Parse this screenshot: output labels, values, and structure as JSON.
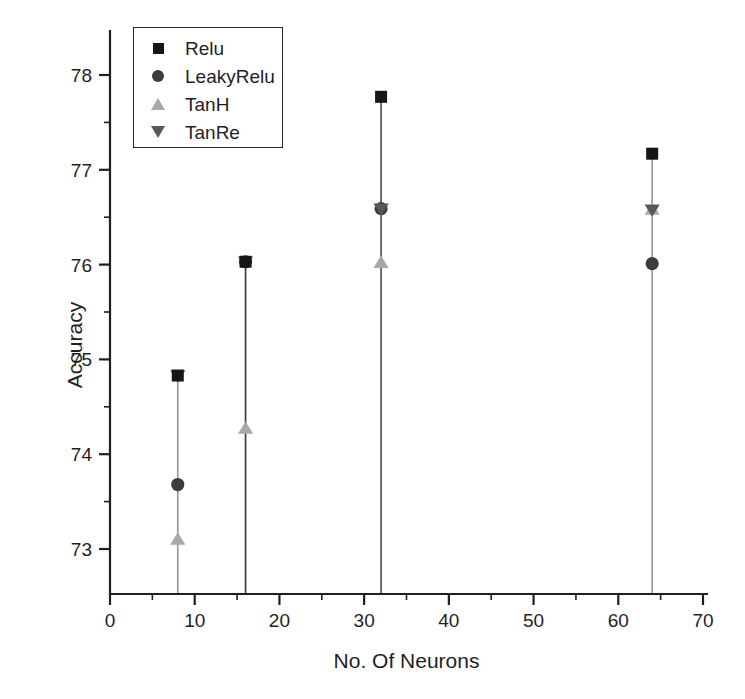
{
  "chart_data": {
    "type": "scatter",
    "title": "",
    "xlabel": "No. Of Neurons",
    "ylabel": "Accuracy",
    "xlim": [
      0,
      70
    ],
    "ylim": [
      72.62,
      78.4
    ],
    "xticks": [
      0,
      10,
      20,
      30,
      40,
      50,
      60,
      70
    ],
    "yticks": [
      73,
      74,
      75,
      76,
      77,
      78
    ],
    "xtick_labels": [
      "0",
      "10",
      "20",
      "30",
      "40",
      "50",
      "60",
      "70"
    ],
    "ytick_labels": [
      "73",
      "74",
      "75",
      "76",
      "77",
      "78"
    ],
    "x_minor_step": 5,
    "y_minor_step": 0.5,
    "grid": false,
    "legend_position": "upper-left",
    "x": [
      8,
      16,
      32,
      64
    ],
    "series": [
      {
        "name": "Relu",
        "marker": "square",
        "color": "#161616",
        "values": [
          74.83,
          76.03,
          77.77,
          77.17
        ]
      },
      {
        "name": "LeakyRelu",
        "marker": "circle",
        "color": "#3c3c3c",
        "values": [
          73.68,
          76.03,
          76.59,
          76.01
        ]
      },
      {
        "name": "TanH",
        "marker": "triangle-up",
        "color": "#a8a8a8",
        "values": [
          73.1,
          74.27,
          76.02,
          76.58
        ]
      },
      {
        "name": "TanRe",
        "marker": "triangle-down",
        "color": "#585858",
        "values": [
          74.83,
          76.03,
          76.59,
          76.58
        ]
      }
    ],
    "stems": [
      {
        "x": 8,
        "top": 74.83,
        "color": "#9a9a9a"
      },
      {
        "x": 16,
        "top": 76.03,
        "color": "#3f3f3f"
      },
      {
        "x": 32,
        "top": 77.77,
        "color": "#555555"
      },
      {
        "x": 64,
        "top": 77.17,
        "color": "#9a9a9a"
      }
    ]
  },
  "legend": {
    "items": [
      {
        "label": "Relu",
        "marker": "square"
      },
      {
        "label": "LeakyRelu",
        "marker": "circle"
      },
      {
        "label": "TanH",
        "marker": "triangle-up"
      },
      {
        "label": "TanRe",
        "marker": "triangle-down"
      }
    ]
  },
  "axes": {
    "x_title": "No. Of Neurons",
    "y_title": "Accuracy"
  }
}
